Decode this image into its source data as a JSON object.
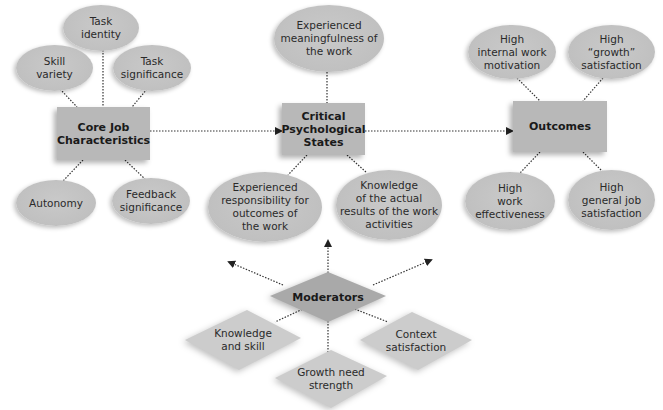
{
  "diagram": {
    "core": {
      "label": "Core Job Characteristics",
      "label_line1": "Core Job",
      "label_line2": "Characteristics",
      "items": [
        {
          "line1": "Task",
          "line2": "identity"
        },
        {
          "line1": "Skill",
          "line2": "variety"
        },
        {
          "line1": "Task",
          "line2": "significance"
        },
        {
          "line1": "Autonomy",
          "line2": ""
        },
        {
          "line1": "Feedback",
          "line2": "significance"
        }
      ]
    },
    "critical": {
      "label_line1": "Critical",
      "label_line2": "Psychological",
      "label_line3": "States",
      "items": [
        {
          "line1": "Experienced",
          "line2": "meaningfulness of",
          "line3": "the work"
        },
        {
          "line1": "Experienced",
          "line2": "responsibility for",
          "line3": "outcomes of",
          "line4": "the work"
        },
        {
          "line1": "Knowledge",
          "line2": "of the actual",
          "line3": "results of the work",
          "line4": "activities"
        }
      ]
    },
    "outcomes": {
      "label": "Outcomes",
      "items": [
        {
          "line1": "High",
          "line2": "internal work",
          "line3": "motivation"
        },
        {
          "line1": "High",
          "line2": "“growth”",
          "line3": "satisfaction"
        },
        {
          "line1": "High",
          "line2": "work",
          "line3": "effectiveness"
        },
        {
          "line1": "High",
          "line2": "general job",
          "line3": "satisfaction"
        }
      ]
    },
    "moderators": {
      "label": "Moderators",
      "items": [
        {
          "line1": "Knowledge",
          "line2": "and skill"
        },
        {
          "line1": "Growth need",
          "line2": "strength"
        },
        {
          "line1": "Context",
          "line2": "satisfaction"
        }
      ]
    },
    "colors": {
      "node_fill": "#c2c2c2",
      "box_fill": "#b8b8b8",
      "moderator_fill": "#a9a9a9",
      "moderator_item_fill": "#cccccc",
      "connector": "#333333"
    }
  }
}
